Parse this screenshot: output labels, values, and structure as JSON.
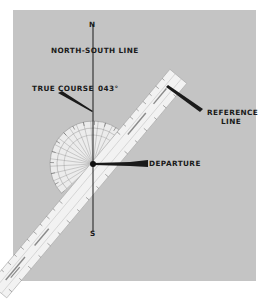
{
  "figure": {
    "background_color": "#c4c4c4",
    "labels": {
      "north": "N",
      "south": "S",
      "north_south_line": "NORTH-SOUTH LINE",
      "true_course": "TRUE COURSE",
      "true_course_value": "043°",
      "reference_line_1": "REFERENCE",
      "reference_line_2": "LINE",
      "departure": "DEPARTURE"
    },
    "objects": {
      "plotter": "plotter-ruler",
      "protractor": "semicircular-protractor",
      "course_angle_degrees": 43
    }
  }
}
